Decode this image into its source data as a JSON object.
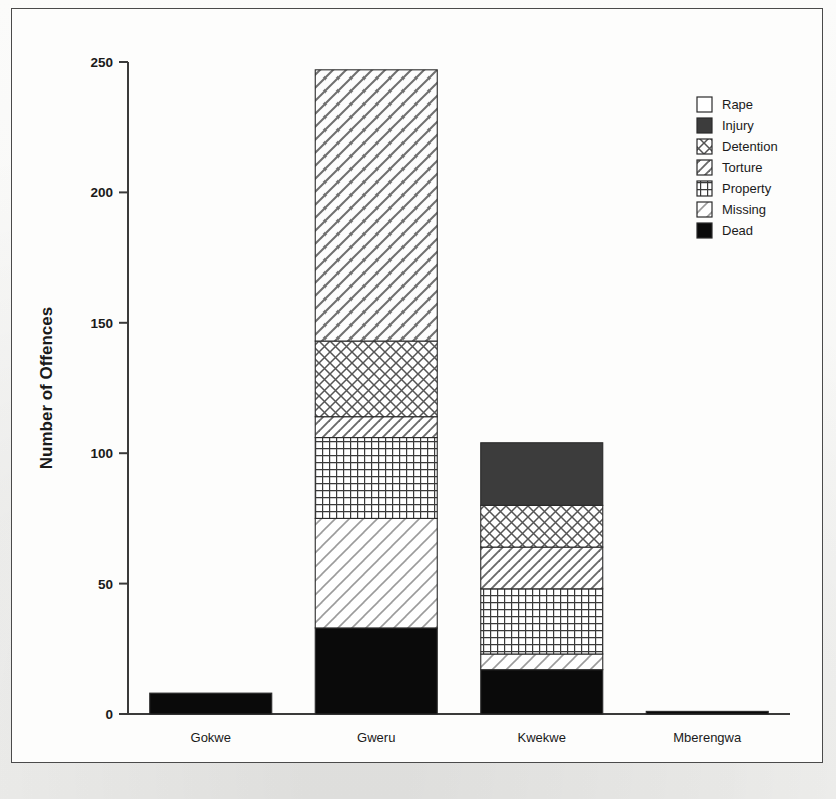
{
  "figure": {
    "frame": true
  },
  "chart_data": {
    "type": "bar",
    "subtype": "stacked-bar",
    "title": "",
    "xlabel": "",
    "ylabel": "Number of Offences",
    "ylim": [
      0,
      250
    ],
    "yticks": [
      0,
      50,
      100,
      150,
      200,
      250
    ],
    "ytick_labels": [
      "0",
      "50",
      "100",
      "150",
      "200",
      "250"
    ],
    "grid": false,
    "legend_position": "top-right",
    "categories": [
      "Gokwe",
      "Gweru",
      "Kwekwe",
      "Mberengwa"
    ],
    "series": [
      {
        "name": "Dead",
        "values": [
          8,
          33,
          17,
          1
        ]
      },
      {
        "name": "Missing",
        "values": [
          0,
          42,
          6,
          0
        ]
      },
      {
        "name": "Property",
        "values": [
          0,
          31,
          25,
          0
        ]
      },
      {
        "name": "Torture",
        "values": [
          0,
          8,
          16,
          0
        ]
      },
      {
        "name": "Detention",
        "values": [
          0,
          29,
          16,
          0
        ]
      },
      {
        "name": "Injury",
        "values": [
          0,
          0,
          24,
          0
        ]
      },
      {
        "name": "Rape",
        "values": [
          0,
          104,
          0,
          0
        ]
      }
    ],
    "stack_order_bottom_to_top": [
      "Dead",
      "Missing",
      "Property",
      "Torture",
      "Detention",
      "Injury",
      "Rape"
    ],
    "totals": [
      8,
      247,
      104,
      1
    ]
  },
  "legend": {
    "items": [
      {
        "label": "Rape",
        "pattern": "empty"
      },
      {
        "label": "Injury",
        "pattern": "solid-dark"
      },
      {
        "label": "Detention",
        "pattern": "crosshatch"
      },
      {
        "label": "Torture",
        "pattern": "diagonal-light"
      },
      {
        "label": "Property",
        "pattern": "grid"
      },
      {
        "label": "Missing",
        "pattern": "diagonal-sparse"
      },
      {
        "label": "Dead",
        "pattern": "solid-black"
      }
    ]
  },
  "axis": {
    "y_label": "Number of Offences",
    "y_ticks": [
      "250",
      "200",
      "150",
      "100",
      "50",
      "0"
    ],
    "x_categories": [
      "Gokwe",
      "Gweru",
      "Kwekwe",
      "Mberengwa"
    ]
  },
  "colors": {
    "ink": "#1a1a1a",
    "axis": "#3a3a3a",
    "frame": "#4a4a4a",
    "paper": "#fdfdfc",
    "solid_black": "#0a0a0a",
    "solid_dark": "#3c3c3c",
    "hatch": "#555555"
  }
}
